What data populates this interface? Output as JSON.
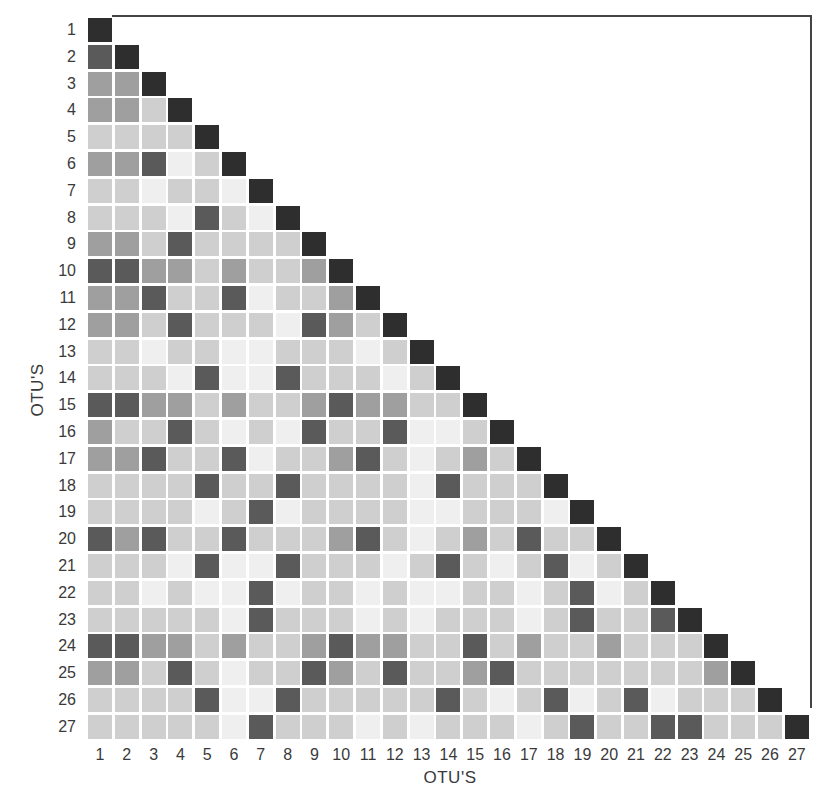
{
  "chart_data": {
    "type": "heatmap",
    "title": "",
    "xlabel": "OTU'S",
    "ylabel": "OTU'S",
    "layout": "lower-triangular similarity matrix",
    "grid": false,
    "legend": null,
    "categories": [
      "1",
      "2",
      "3",
      "4",
      "5",
      "6",
      "7",
      "8",
      "9",
      "10",
      "11",
      "12",
      "13",
      "14",
      "15",
      "16",
      "17",
      "18",
      "19",
      "20",
      "21",
      "22",
      "23",
      "24",
      "25",
      "26",
      "27"
    ],
    "shade_scale": {
      "levels": [
        0,
        1,
        2,
        3,
        4
      ],
      "description": "0 = very light, 1 = light gray, 2 = medium gray, 3 = dark gray, 4 = black (diagonal / highest similarity)",
      "colors": [
        "#efefef",
        "#cfcfcf",
        "#9f9f9f",
        "#5a5a5a",
        "#2e2e2e"
      ]
    },
    "rows": [
      [
        4
      ],
      [
        3,
        4
      ],
      [
        2,
        2,
        4
      ],
      [
        2,
        2,
        1,
        4
      ],
      [
        1,
        1,
        1,
        1,
        4
      ],
      [
        2,
        2,
        3,
        0,
        1,
        4
      ],
      [
        1,
        1,
        0,
        1,
        1,
        0,
        4
      ],
      [
        1,
        1,
        1,
        0,
        3,
        1,
        0,
        4
      ],
      [
        2,
        2,
        1,
        3,
        1,
        1,
        1,
        1,
        4
      ],
      [
        3,
        3,
        2,
        2,
        1,
        2,
        1,
        1,
        2,
        4
      ],
      [
        2,
        2,
        3,
        1,
        1,
        3,
        0,
        1,
        1,
        2,
        4
      ],
      [
        2,
        2,
        1,
        3,
        1,
        1,
        1,
        0,
        3,
        2,
        1,
        4
      ],
      [
        1,
        1,
        0,
        1,
        1,
        0,
        0,
        1,
        1,
        1,
        0,
        1,
        4
      ],
      [
        1,
        1,
        1,
        0,
        3,
        0,
        0,
        3,
        1,
        1,
        1,
        0,
        1,
        4
      ],
      [
        3,
        3,
        2,
        2,
        1,
        2,
        1,
        1,
        2,
        3,
        2,
        2,
        1,
        1,
        4
      ],
      [
        2,
        1,
        1,
        3,
        1,
        0,
        1,
        0,
        3,
        1,
        1,
        3,
        0,
        0,
        1,
        4
      ],
      [
        2,
        2,
        3,
        1,
        1,
        3,
        0,
        1,
        1,
        2,
        3,
        1,
        0,
        1,
        2,
        1,
        4
      ],
      [
        1,
        1,
        1,
        1,
        3,
        1,
        1,
        3,
        1,
        1,
        1,
        1,
        0,
        3,
        1,
        1,
        1,
        4
      ],
      [
        1,
        1,
        1,
        1,
        0,
        1,
        3,
        0,
        1,
        1,
        1,
        1,
        0,
        0,
        1,
        1,
        1,
        0,
        4
      ],
      [
        3,
        2,
        3,
        1,
        1,
        3,
        1,
        1,
        1,
        2,
        3,
        1,
        0,
        1,
        2,
        1,
        3,
        1,
        1,
        4
      ],
      [
        1,
        1,
        1,
        0,
        3,
        0,
        0,
        3,
        1,
        1,
        1,
        0,
        1,
        3,
        1,
        0,
        1,
        3,
        0,
        1,
        4
      ],
      [
        1,
        1,
        0,
        1,
        0,
        0,
        3,
        0,
        1,
        1,
        0,
        1,
        0,
        0,
        1,
        1,
        0,
        1,
        3,
        0,
        1,
        4
      ],
      [
        1,
        1,
        1,
        1,
        1,
        0,
        3,
        1,
        1,
        1,
        0,
        1,
        0,
        1,
        1,
        1,
        0,
        1,
        3,
        1,
        1,
        3,
        4
      ],
      [
        3,
        3,
        2,
        2,
        1,
        2,
        1,
        1,
        2,
        3,
        2,
        2,
        1,
        1,
        3,
        1,
        2,
        1,
        1,
        2,
        1,
        1,
        1,
        4
      ],
      [
        2,
        2,
        1,
        3,
        1,
        0,
        1,
        1,
        3,
        2,
        1,
        3,
        1,
        1,
        2,
        3,
        1,
        1,
        1,
        1,
        1,
        1,
        1,
        2,
        4
      ],
      [
        1,
        1,
        1,
        1,
        3,
        0,
        0,
        3,
        1,
        1,
        1,
        1,
        1,
        3,
        1,
        0,
        1,
        3,
        0,
        1,
        3,
        0,
        1,
        1,
        1,
        4
      ],
      [
        1,
        1,
        1,
        1,
        1,
        0,
        3,
        1,
        1,
        1,
        0,
        1,
        0,
        1,
        1,
        1,
        0,
        1,
        3,
        1,
        1,
        3,
        3,
        1,
        1,
        1,
        4
      ]
    ]
  }
}
